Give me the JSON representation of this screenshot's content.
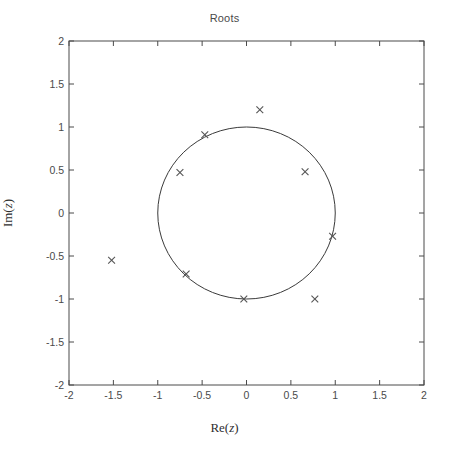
{
  "chart_data": {
    "type": "scatter",
    "title": "Roots",
    "xlabel": "Re(z)",
    "ylabel": "Im(z)",
    "xlim": [
      -2,
      2
    ],
    "ylim": [
      -2,
      2
    ],
    "grid": false,
    "legend": null,
    "xticks": [
      "-2",
      "-1.5",
      "-1",
      "-0.5",
      "0",
      "0.5",
      "1",
      "1.5",
      "2"
    ],
    "xtick_values": [
      -2,
      -1.5,
      -1,
      -0.5,
      0,
      0.5,
      1,
      1.5,
      2
    ],
    "yticks": [
      "-2",
      "-1.5",
      "-1",
      "-0.5",
      "0",
      "0.5",
      "1",
      "1.5",
      "2"
    ],
    "ytick_values": [
      -2,
      -1.5,
      -1,
      -0.5,
      0,
      0.5,
      1,
      1.5,
      2
    ],
    "marker": "x",
    "marker_color": "#555555",
    "series": [
      {
        "name": "roots",
        "x": [
          0.15,
          -0.47,
          -0.75,
          0.66,
          0.97,
          -1.52,
          -0.68,
          -0.03,
          0.77
        ],
        "y": [
          1.2,
          0.91,
          0.47,
          0.48,
          -0.27,
          -0.55,
          -0.71,
          -1.0,
          -1.0
        ]
      }
    ],
    "annotations": [
      {
        "name": "unit-circle",
        "type": "circle",
        "center": [
          0,
          0
        ],
        "radius": 1.0,
        "color": "#3a3a3a",
        "linewidth": 1.0
      }
    ]
  },
  "axes": {
    "box_color": "#4a4a4a",
    "background": "#ffffff"
  }
}
